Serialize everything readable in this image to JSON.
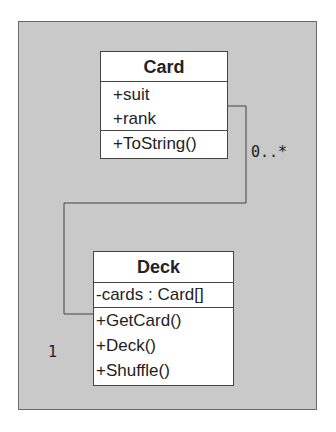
{
  "diagram": {
    "type": "uml-class-diagram",
    "classes": [
      {
        "name": "Card",
        "attributes": [
          "+suit",
          "+rank"
        ],
        "operations": [
          "+ToString()"
        ]
      },
      {
        "name": "Deck",
        "attributes": [
          "-cards : Card[]"
        ],
        "operations": [
          "+GetCard()",
          "+Deck()",
          "+Shuffle()"
        ]
      }
    ],
    "associations": [
      {
        "from": "Deck",
        "to": "Card",
        "from_multiplicity": "1",
        "to_multiplicity": "0..*"
      }
    ]
  },
  "colors": {
    "panel_background": "#c9c9c9",
    "box_background": "#ffffff",
    "line": "#444444"
  }
}
